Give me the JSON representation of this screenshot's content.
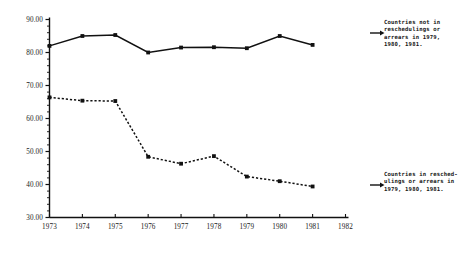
{
  "chart_data": {
    "type": "line",
    "title": "",
    "xlabel": "YEAR",
    "ylabel": "",
    "x": [
      1973,
      1974,
      1975,
      1976,
      1977,
      1978,
      1979,
      1980,
      1981
    ],
    "xlim": [
      1973,
      1982
    ],
    "ylim": [
      30.0,
      90.0
    ],
    "ytick_labels": [
      "90.00",
      "80.00",
      "70.00",
      "60.00",
      "50.00",
      "40.00",
      "30.00"
    ],
    "ytick_values": [
      90.0,
      80.0,
      70.0,
      60.0,
      50.0,
      40.0,
      30.0
    ],
    "yminor_step": 2.0,
    "xtick_labels": [
      "1973",
      "1974",
      "1975",
      "1976",
      "1977",
      "1978",
      "1979",
      "1980",
      "1981",
      "1982"
    ],
    "xtick_values": [
      1973,
      1974,
      1975,
      1976,
      1977,
      1978,
      1979,
      1980,
      1981,
      1982
    ],
    "grid": false,
    "legend_position": "right-annotations",
    "series": [
      {
        "name": "Countries not in reschedulings or arrears in 1979, 1980, 1981.",
        "style": "solid",
        "marker": "filled-square",
        "color": "#111111",
        "values": [
          82.0,
          85.0,
          85.3,
          80.0,
          81.5,
          81.6,
          81.3,
          85.0,
          82.3
        ]
      },
      {
        "name": "Countries in reschedulings or arrears in 1979, 1980, 1981.",
        "style": "dotted",
        "marker": "filled-square",
        "color": "#111111",
        "values": [
          66.4,
          65.4,
          65.3,
          48.4,
          46.3,
          48.6,
          42.4,
          41.0,
          39.4
        ]
      }
    ],
    "annotations": [
      {
        "id": "upper",
        "lines": [
          "Countries not in",
          "reschedulings or",
          "arrears in 1979,",
          "1980, 1981."
        ],
        "target_series": 0
      },
      {
        "id": "lower",
        "lines": [
          "Countries in resched-",
          "ulings or arrears in",
          "1979, 1980, 1981."
        ],
        "target_series": 1
      }
    ]
  },
  "annotation_upper_text": "Countries not in\nreschedulings or\narrears in 1979,\n1980, 1981.",
  "annotation_lower_text": "Countries in resched-\nulings or arrears in\n1979, 1980, 1981."
}
